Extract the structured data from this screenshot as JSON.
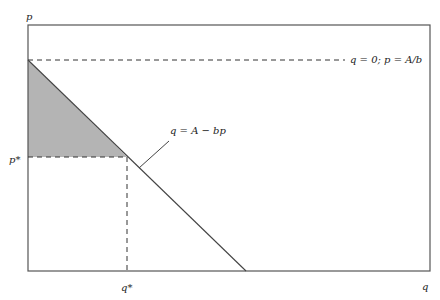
{
  "diagram": {
    "type": "linear demand curve with consumer surplus",
    "axes": {
      "y_label": "p",
      "x_label": "q"
    },
    "curve": {
      "label": "q = A − bp",
      "intercept_label": "q = 0; p = A/b"
    },
    "equilibrium": {
      "p_label": "p*",
      "q_label": "q*"
    },
    "shaded_region": "consumer surplus triangle",
    "colors": {
      "frame": "#555555",
      "curve": "#444444",
      "shade": "#b4b4b4",
      "dash": "#333333"
    }
  }
}
